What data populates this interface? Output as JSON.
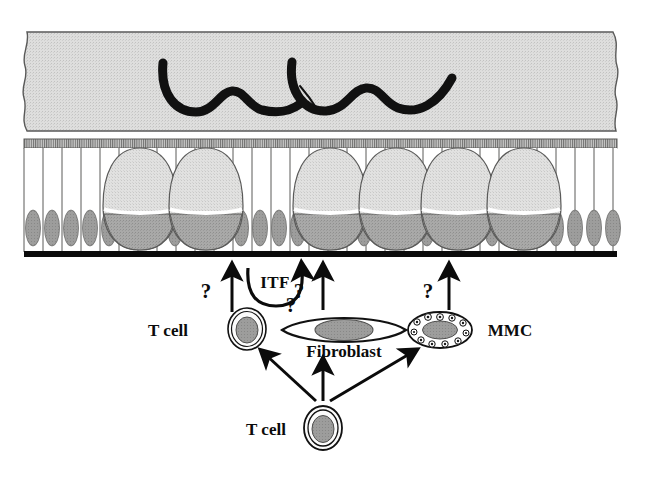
{
  "figure": {
    "domain": "Diagram",
    "kind": "biological-schematic",
    "title_visible": false,
    "background_color": "#ffffff",
    "width": 649,
    "height": 477
  },
  "palette": {
    "mucus_fill": "#d9d9d9",
    "mucus_stroke": "#4a4a4a",
    "worm_color": "#111111",
    "brush_border": "#8a8a8a",
    "epithelium_fill": "#ffffff",
    "epithelium_stroke": "#4a4a4a",
    "nucleus_fill": "#9a9a9a",
    "goblet_body_fill": "#dcdcdc",
    "goblet_base_fill": "#a8a8a8",
    "basement_membrane": "#0b0b0b",
    "cell_outline": "#111111",
    "cytoplasm_fill": "#f7f7f7",
    "arrow_color": "#0b0b0b",
    "text_color": "#0b0b0b"
  },
  "layers": {
    "mucus": {
      "name": "mucus-layer",
      "description": "Stippled grey mucus band with torn wavy left and right edges"
    },
    "brush_border": {
      "name": "brush-border",
      "description": "Hatched microvillus band along top of epithelium"
    },
    "epithelium": {
      "name": "epithelial-layer",
      "description": "Columnar epithelial cells with basal nuclei interleaved with goblet cells"
    },
    "basement_membrane": {
      "name": "basement-membrane",
      "description": "Thick black line beneath the epithelium"
    },
    "lamina_propria": {
      "name": "lamina-propria",
      "description": "White space below the basement membrane containing effector cells"
    }
  },
  "worms": [
    {
      "name": "nematode-worm-1"
    },
    {
      "name": "nematode-worm-2"
    }
  ],
  "goblet_cells": [
    {
      "name": "goblet-cell-1",
      "cx": 140
    },
    {
      "name": "goblet-cell-2",
      "cx": 206
    },
    {
      "name": "goblet-cell-3",
      "cx": 330
    },
    {
      "name": "goblet-cell-4",
      "cx": 396
    },
    {
      "name": "goblet-cell-5",
      "cx": 458
    },
    {
      "name": "goblet-cell-6",
      "cx": 524
    }
  ],
  "cells": {
    "t_cell_upper": {
      "label": "T cell",
      "name": "t-cell-upper",
      "cx": 247,
      "cy": 329
    },
    "t_cell_lower": {
      "label": "T cell",
      "name": "t-cell-lower",
      "cx": 323,
      "cy": 428
    },
    "fibroblast": {
      "label": "Fibroblast",
      "name": "fibroblast",
      "cx": 344,
      "cy": 330
    },
    "mmc": {
      "label": "MMC",
      "name": "mucosal-mast-cell",
      "cx": 440,
      "cy": 330,
      "granule_count": 11
    }
  },
  "annotations": {
    "itf": "ITF",
    "question_marks": [
      {
        "name": "question-mark-t-cell",
        "text": "?",
        "x": 206,
        "y": 298
      },
      {
        "name": "question-mark-itf",
        "text": "?",
        "x": 291,
        "y": 312
      },
      {
        "name": "question-mark-fibroblast",
        "text": "?",
        "x": 329,
        "y": 298
      },
      {
        "name": "question-mark-mmc",
        "text": "?",
        "x": 428,
        "y": 298
      }
    ]
  },
  "arrows": [
    {
      "name": "arrow-t-cell-to-epithelium",
      "from": "t-cell-upper",
      "to": "epithelium"
    },
    {
      "name": "arrow-itf-to-epithelium",
      "from": "itf-curve",
      "to": "epithelium"
    },
    {
      "name": "arrow-fibroblast-to-epithelium",
      "from": "fibroblast",
      "to": "epithelium"
    },
    {
      "name": "arrow-mmc-to-epithelium",
      "from": "mucosal-mast-cell",
      "to": "epithelium"
    },
    {
      "name": "arrow-t-cell-lower-to-t-cell-upper",
      "from": "t-cell-lower",
      "to": "t-cell-upper"
    },
    {
      "name": "arrow-t-cell-lower-to-fibroblast",
      "from": "t-cell-lower",
      "to": "fibroblast"
    },
    {
      "name": "arrow-t-cell-lower-to-mmc",
      "from": "t-cell-lower",
      "to": "mucosal-mast-cell"
    }
  ]
}
